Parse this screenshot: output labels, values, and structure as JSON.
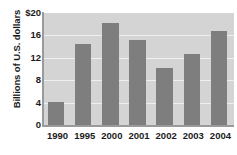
{
  "chart_data": {
    "type": "bar",
    "title": "",
    "xlabel": "",
    "ylabel": "Billions of U.S. dollars",
    "categories": [
      "1990",
      "1995",
      "2000",
      "2001",
      "2002",
      "2003",
      "2004"
    ],
    "values": [
      4.1,
      14.4,
      18.2,
      15.1,
      10.2,
      12.6,
      16.8
    ],
    "ylim": [
      0,
      20
    ],
    "ytick_values": [
      0,
      4,
      8,
      12,
      16,
      20
    ],
    "ytick_labels": [
      "0",
      "4",
      "8",
      "12",
      "16",
      "$20"
    ],
    "grid": true,
    "legend": null,
    "series": [
      {
        "name": "Billions of U.S. dollars",
        "values": [
          4.1,
          14.4,
          18.2,
          15.1,
          10.2,
          12.6,
          16.8
        ]
      }
    ],
    "colors": {
      "bar": "#7e7e7e",
      "plot_background": "#d4d4d4",
      "gridline": "#efefef",
      "axis": "#9a9a9a",
      "text": "#1b1b1b",
      "figure_background": "#ffffff"
    }
  }
}
